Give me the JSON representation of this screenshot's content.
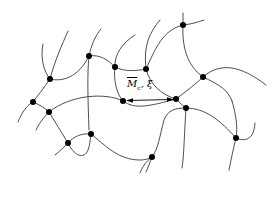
{
  "diagram": {
    "type": "polymer-network",
    "label": {
      "symbol": "M",
      "subscript": "c",
      "separator": ", ",
      "greek": "ξ",
      "full_text": "M̄c, ξ"
    },
    "colors": {
      "chain": "#3a3a3a",
      "node": "#000000",
      "background": "#ffffff"
    },
    "nodes": [
      {
        "id": "A",
        "x": 50,
        "y": 79
      },
      {
        "id": "B",
        "x": 89,
        "y": 56
      },
      {
        "id": "C",
        "x": 115,
        "y": 67
      },
      {
        "id": "I",
        "x": 183,
        "y": 25
      },
      {
        "id": "O",
        "x": 146,
        "y": 69
      },
      {
        "id": "J",
        "x": 203,
        "y": 77
      },
      {
        "id": "D",
        "x": 33,
        "y": 102
      },
      {
        "id": "E",
        "x": 49,
        "y": 112
      },
      {
        "id": "H",
        "x": 123,
        "y": 101
      },
      {
        "id": "K",
        "x": 176,
        "y": 99
      },
      {
        "id": "L",
        "x": 186,
        "y": 108
      },
      {
        "id": "F",
        "x": 68,
        "y": 143
      },
      {
        "id": "G",
        "x": 91,
        "y": 134
      },
      {
        "id": "M",
        "x": 236,
        "y": 138
      },
      {
        "id": "N",
        "x": 152,
        "y": 157
      }
    ],
    "arrow": {
      "x1": 126,
      "y1": 101,
      "x2": 173,
      "y2": 99,
      "double_headed": true
    }
  }
}
